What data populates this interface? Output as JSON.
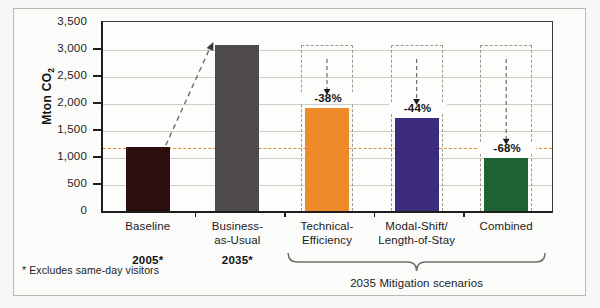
{
  "chart_data": {
    "type": "bar",
    "title": "",
    "xlabel": "",
    "ylabel": "Mton CO",
    "ylabel_sub": "2",
    "ylim": [
      0,
      3500
    ],
    "ytick_values": [
      0,
      500,
      1000,
      1500,
      2000,
      2500,
      3000,
      3500
    ],
    "ytick_labels": [
      "0",
      "500",
      "1,000",
      "1,500",
      "2,000",
      "2,500",
      "3,000",
      "3,500"
    ],
    "grid": true,
    "legend": "none",
    "categories": [
      "Baseline",
      "Business-as-Usual",
      "Technical-Efficiency",
      "Modal-Shift/Length-of-Stay",
      "Combined"
    ],
    "category_label_lines": [
      [
        "Baseline"
      ],
      [
        "Business-",
        "as-Usual"
      ],
      [
        "Technical-",
        "Efficiency"
      ],
      [
        "Modal-Shift/",
        "Length-of-Stay"
      ],
      [
        "Combined"
      ]
    ],
    "values": [
      1180,
      3080,
      1910,
      1725,
      985
    ],
    "bar_colors": [
      "#2b0f0f",
      "#4e4a49",
      "#ef8a2b",
      "#3d2b7e",
      "#1e6334"
    ],
    "reference_level": 3080,
    "baseline_reference_line": 1180,
    "baseline_reference_color": "#e08a2e",
    "annotations": [
      {
        "category": "Technical-Efficiency",
        "text": "-38%"
      },
      {
        "category": "Modal-Shift/Length-of-Stay",
        "text": "-44%"
      },
      {
        "category": "Combined",
        "text": "-68%"
      }
    ],
    "growth_arrow": {
      "from": "Baseline",
      "to": "Business-as-Usual",
      "style": "dashed"
    }
  },
  "groups": [
    {
      "label": "2005*",
      "categories": [
        "Baseline"
      ]
    },
    {
      "label": "2035*",
      "categories": [
        "Business-as-Usual"
      ]
    }
  ],
  "brace": {
    "label": "2035 Mitigation scenarios",
    "categories": [
      "Technical-Efficiency",
      "Modal-Shift/Length-of-Stay",
      "Combined"
    ]
  },
  "footnote": "* Excludes same-day visitors"
}
